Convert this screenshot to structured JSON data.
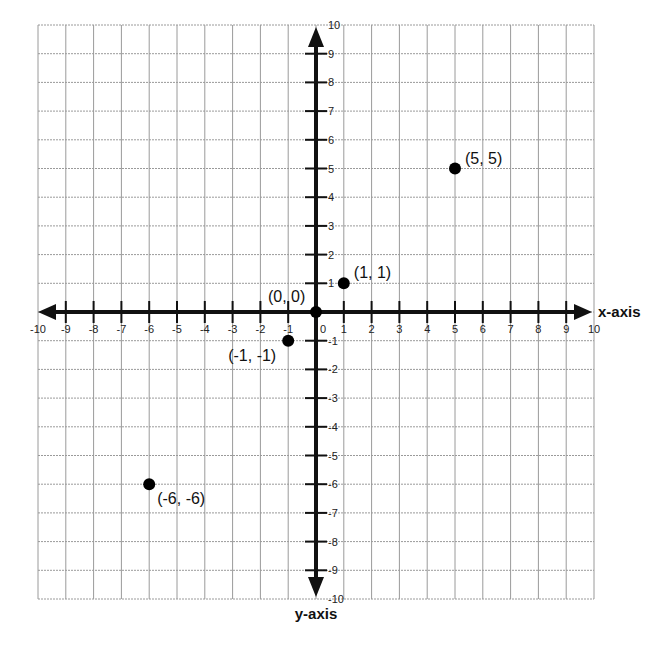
{
  "chart_data": {
    "type": "scatter",
    "title": "",
    "xlabel": "x-axis",
    "ylabel": "y-axis",
    "xlim": [
      -10,
      10
    ],
    "ylim": [
      -10,
      10
    ],
    "grid": true,
    "legend": "none",
    "x_ticks": [
      -10,
      -9,
      -8,
      -7,
      -6,
      -5,
      -4,
      -3,
      -2,
      -1,
      0,
      1,
      2,
      3,
      4,
      5,
      6,
      7,
      8,
      9,
      10
    ],
    "y_ticks": [
      -10,
      -9,
      -8,
      -7,
      -6,
      -5,
      -4,
      -3,
      -2,
      -1,
      1,
      2,
      3,
      4,
      5,
      6,
      7,
      8,
      9,
      10
    ],
    "points": [
      {
        "x": 0,
        "y": 0,
        "label": "(0, 0)"
      },
      {
        "x": 1,
        "y": 1,
        "label": "(1, 1)"
      },
      {
        "x": 5,
        "y": 5,
        "label": "(5, 5)"
      },
      {
        "x": -1,
        "y": -1,
        "label": "(-1, -1)"
      },
      {
        "x": -6,
        "y": -6,
        "label": "(-6, -6)"
      }
    ]
  },
  "layout": {
    "origin_px": [
      316,
      312
    ],
    "unit_x_px": 27.8,
    "unit_y_px": 28.7,
    "colors": {
      "grid": "#9a9a9a",
      "axis": "#111111",
      "point": "#000000"
    }
  }
}
